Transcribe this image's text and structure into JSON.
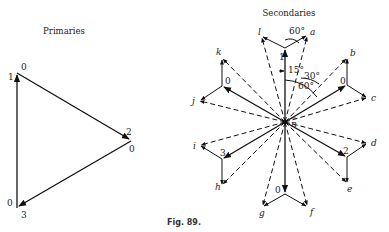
{
  "primaries": {
    "title": "Primaries",
    "vertices": {
      "top": {
        "labels": [
          "1",
          "0"
        ]
      },
      "right": {
        "labels": [
          "2",
          "0"
        ]
      },
      "bottom": {
        "labels": [
          "0",
          "3"
        ]
      }
    }
  },
  "secondaries": {
    "title": "Secondaries",
    "neutral_label": "n",
    "phase_labels": [
      "1",
      "0",
      "0",
      "3",
      "2",
      "0"
    ],
    "letters": [
      "a",
      "b",
      "c",
      "d",
      "e",
      "f",
      "g",
      "h",
      "i",
      "j",
      "k",
      "l"
    ],
    "angles": [
      "60°",
      "15°",
      "30°",
      "60°"
    ]
  },
  "caption": "Fig. 89."
}
